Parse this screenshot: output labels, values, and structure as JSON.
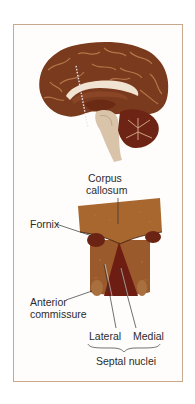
{
  "figure": {
    "top_panel": "Midsagittal view of human brain with dotted coronal section line",
    "bottom_panel": "Coronal section through septal region"
  },
  "labels": {
    "corpus_callosum_1": "Corpus",
    "corpus_callosum_2": "callosum",
    "fornix": "Fornix",
    "anterior_commissure_1": "Anterior",
    "anterior_commissure_2": "commissure",
    "lateral": "Lateral",
    "medial": "Medial",
    "septal_nuclei": "Septal nuclei"
  },
  "colors": {
    "frame_border": "#c9a98d",
    "cortex": "#7a3a1e",
    "cortex_light": "#b8774a",
    "septum_tissue": "#9a5a2c",
    "medial_nucleus": "#6e1d12",
    "fornix": "#6b2414",
    "brainstem": "#d9c4aa"
  }
}
